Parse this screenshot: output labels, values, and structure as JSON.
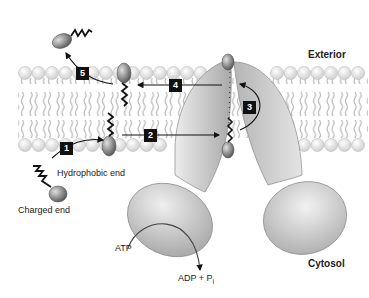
{
  "diagram": {
    "title": "",
    "regions": {
      "exterior": "Exterior",
      "cytosol": "Cytosol"
    },
    "molecule_labels": {
      "hydrophobic_end": "Hydrophobic end",
      "charged_end": "Charged end"
    },
    "reaction": {
      "substrate": "ATP",
      "product_main": "ADP + P",
      "product_sub": "i"
    },
    "steps": [
      {
        "id": "1",
        "label": "1"
      },
      {
        "id": "2",
        "label": "2"
      },
      {
        "id": "3",
        "label": "3"
      },
      {
        "id": "4",
        "label": "4"
      },
      {
        "id": "5",
        "label": "5"
      }
    ],
    "colors": {
      "membrane_head": "#e6e6e6",
      "protein": "#c8c8c8",
      "molecule_head": "#8a8a8a",
      "step_box": "#111111",
      "text": "#222222"
    }
  }
}
